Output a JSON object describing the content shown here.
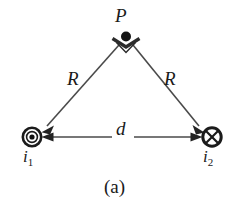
{
  "figure": {
    "caption": "(a)",
    "colors": {
      "stroke": "#2b2b2b",
      "line": "#4a4a4a",
      "text": "#1a1a1a",
      "background": "#ffffff"
    },
    "nodes": [
      {
        "id": "apex-point",
        "label": "P",
        "icon": "point-dot-icon",
        "x": 126,
        "y": 36,
        "meaning": "field point"
      },
      {
        "id": "wire-1",
        "label": "i",
        "subscript": "1",
        "icon": "current-out-of-page-icon",
        "x": 32,
        "y": 137,
        "meaning": "current out of page"
      },
      {
        "id": "wire-2",
        "label": "i",
        "subscript": "2",
        "icon": "current-into-page-icon",
        "x": 212,
        "y": 137,
        "meaning": "current into page"
      }
    ],
    "edges": [
      {
        "id": "edge-R-left",
        "label": "R",
        "from": "apex-point",
        "to": "wire-1",
        "arrow": "to"
      },
      {
        "id": "edge-R-right",
        "label": "R",
        "from": "apex-point",
        "to": "wire-2",
        "arrow": "to"
      },
      {
        "id": "edge-d",
        "label": "d",
        "from": "wire-1",
        "to": "wire-2",
        "arrow": "both"
      }
    ],
    "markers": [
      {
        "id": "right-angle-marker",
        "icon": "right-angle-square-icon",
        "at": "apex-point",
        "meaning": "90 degree angle between R segments"
      }
    ]
  }
}
